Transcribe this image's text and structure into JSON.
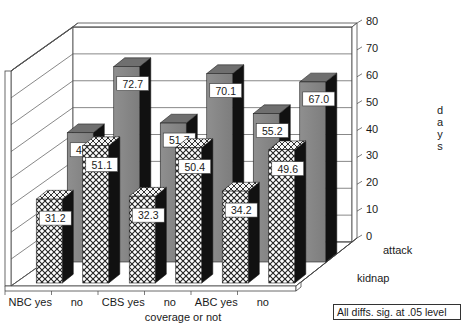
{
  "chart_data": {
    "type": "bar",
    "subtype": "3d-grouped-bar",
    "title": "",
    "xlabel": "coverage or not",
    "ylabel": "days",
    "ylim": [
      0,
      80
    ],
    "yticks": [
      0,
      10,
      20,
      30,
      40,
      50,
      60,
      70,
      80
    ],
    "grid": true,
    "categories": [
      "NBC yes",
      "no",
      "CBS yes",
      "no",
      "ABC yes",
      "no"
    ],
    "series": [
      {
        "name": "kidnap",
        "pattern": "crosshatch",
        "values": [
          31.2,
          51.1,
          32.3,
          50.4,
          34.2,
          49.6
        ]
      },
      {
        "name": "attack",
        "pattern": "solid-gray",
        "values": [
          48.1,
          72.7,
          51.7,
          70.1,
          55.2,
          67.0
        ]
      }
    ],
    "depth_labels": [
      "attack",
      "kidnap"
    ],
    "annotation": "All diffs. sig. at .05 level",
    "colors": {
      "attack_face": "#8c8c8c",
      "attack_top": "#777777",
      "side": "#111111",
      "background": "#ffffff"
    }
  },
  "labels": {
    "xlabel": "coverage or not",
    "ylabel_letters": [
      "d",
      "a",
      "y",
      "s"
    ],
    "note": "All diffs. sig. at .05 level",
    "depth_attack": "attack",
    "depth_kidnap": "kidnap"
  }
}
